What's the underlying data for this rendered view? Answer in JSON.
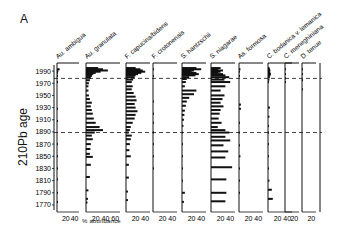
{
  "panel_label": "A",
  "chart_data": {
    "type": "bar",
    "orientation": "horizontal-stratigraphic",
    "title": "",
    "panel": "A",
    "ylabel": "210Pb age",
    "xlabel": "% abundance",
    "y_ticks": [
      1990,
      1970,
      1950,
      1930,
      1910,
      1890,
      1870,
      1850,
      1830,
      1810,
      1790,
      1770
    ],
    "ylim": [
      1765,
      2000
    ],
    "reference_lines": [
      {
        "year": 1978,
        "style": "dashed"
      },
      {
        "year": 1889,
        "style": "dashed"
      }
    ],
    "series": [
      {
        "name": "Au. ambigua",
        "x_ticks": [
          "20",
          "40"
        ],
        "xmax": 50,
        "points": [
          [
            1993,
            6
          ],
          [
            1990,
            3
          ],
          [
            1987,
            2
          ],
          [
            1982,
            1
          ],
          [
            1972,
            1
          ],
          [
            1928,
            1
          ],
          [
            1908,
            1
          ],
          [
            1870,
            1
          ],
          [
            1850,
            1
          ],
          [
            1830,
            1
          ],
          [
            1812,
            1
          ],
          [
            1790,
            1
          ],
          [
            1775,
            1
          ]
        ]
      },
      {
        "name": "Au. granulata",
        "x_ticks": [
          "20",
          "40",
          "60"
        ],
        "xmax": 70,
        "points": [
          [
            1995,
            25
          ],
          [
            1993,
            35
          ],
          [
            1991,
            45
          ],
          [
            1989,
            30
          ],
          [
            1987,
            20
          ],
          [
            1985,
            15
          ],
          [
            1982,
            12
          ],
          [
            1979,
            10
          ],
          [
            1975,
            8
          ],
          [
            1970,
            6
          ],
          [
            1965,
            5
          ],
          [
            1958,
            5
          ],
          [
            1950,
            6
          ],
          [
            1944,
            8
          ],
          [
            1938,
            12
          ],
          [
            1932,
            10
          ],
          [
            1926,
            12
          ],
          [
            1920,
            14
          ],
          [
            1912,
            16
          ],
          [
            1905,
            20
          ],
          [
            1898,
            28
          ],
          [
            1893,
            35
          ],
          [
            1889,
            18
          ],
          [
            1884,
            12
          ],
          [
            1878,
            14
          ],
          [
            1870,
            10
          ],
          [
            1862,
            9
          ],
          [
            1854,
            8
          ],
          [
            1849,
            14
          ],
          [
            1836,
            10
          ],
          [
            1816,
            8
          ],
          [
            1794,
            5
          ],
          [
            1780,
            4
          ],
          [
            1774,
            3
          ]
        ]
      },
      {
        "name": "F. capucina/bidens",
        "x_ticks": [
          "20",
          "40"
        ],
        "xmax": 50,
        "points": [
          [
            1995,
            20
          ],
          [
            1993,
            30
          ],
          [
            1991,
            35
          ],
          [
            1989,
            40
          ],
          [
            1987,
            32
          ],
          [
            1985,
            25
          ],
          [
            1983,
            20
          ],
          [
            1980,
            18
          ],
          [
            1976,
            15
          ],
          [
            1972,
            12
          ],
          [
            1965,
            14
          ],
          [
            1960,
            12
          ],
          [
            1954,
            16
          ],
          [
            1948,
            20
          ],
          [
            1942,
            22
          ],
          [
            1936,
            18
          ],
          [
            1930,
            20
          ],
          [
            1924,
            24
          ],
          [
            1918,
            20
          ],
          [
            1912,
            18
          ],
          [
            1905,
            14
          ],
          [
            1898,
            10
          ],
          [
            1893,
            8
          ],
          [
            1889,
            6
          ],
          [
            1884,
            12
          ],
          [
            1878,
            10
          ],
          [
            1870,
            8
          ],
          [
            1860,
            7
          ],
          [
            1850,
            10
          ],
          [
            1836,
            6
          ],
          [
            1815,
            6
          ],
          [
            1792,
            4
          ],
          [
            1778,
            4
          ]
        ]
      },
      {
        "name": "F. crotonensis",
        "x_ticks": [
          "20",
          "40"
        ],
        "xmax": 50,
        "points": [
          [
            1993,
            2
          ],
          [
            1982,
            1
          ],
          [
            1940,
            1
          ],
          [
            1920,
            1
          ],
          [
            1905,
            1
          ],
          [
            1889,
            1
          ],
          [
            1870,
            1
          ],
          [
            1850,
            1
          ],
          [
            1830,
            1
          ]
        ]
      },
      {
        "name": "S. hantzschii",
        "x_ticks": [
          "20",
          "40"
        ],
        "xmax": 50,
        "points": [
          [
            1995,
            30
          ],
          [
            1993,
            40
          ],
          [
            1991,
            25
          ],
          [
            1989,
            20
          ],
          [
            1987,
            30
          ],
          [
            1985,
            35
          ],
          [
            1983,
            28
          ],
          [
            1980,
            15
          ],
          [
            1977,
            10
          ],
          [
            1972,
            8
          ],
          [
            1965,
            6
          ],
          [
            1958,
            30
          ],
          [
            1952,
            25
          ],
          [
            1946,
            15
          ],
          [
            1940,
            10
          ],
          [
            1933,
            8
          ],
          [
            1925,
            6
          ],
          [
            1918,
            5
          ],
          [
            1910,
            4
          ],
          [
            1900,
            3
          ],
          [
            1889,
            2
          ],
          [
            1870,
            2
          ],
          [
            1850,
            2
          ],
          [
            1830,
            2
          ],
          [
            1810,
            2
          ],
          [
            1790,
            6
          ],
          [
            1775,
            4
          ]
        ]
      },
      {
        "name": "S. niagarae",
        "x_ticks": [
          "20",
          "40"
        ],
        "xmax": 50,
        "points": [
          [
            1995,
            20
          ],
          [
            1993,
            15
          ],
          [
            1991,
            25
          ],
          [
            1989,
            20
          ],
          [
            1987,
            15
          ],
          [
            1985,
            25
          ],
          [
            1983,
            30
          ],
          [
            1980,
            38
          ],
          [
            1976,
            28
          ],
          [
            1972,
            40
          ],
          [
            1965,
            30
          ],
          [
            1958,
            20
          ],
          [
            1950,
            28
          ],
          [
            1944,
            24
          ],
          [
            1938,
            20
          ],
          [
            1932,
            26
          ],
          [
            1926,
            20
          ],
          [
            1920,
            18
          ],
          [
            1912,
            16
          ],
          [
            1905,
            22
          ],
          [
            1898,
            14
          ],
          [
            1893,
            30
          ],
          [
            1889,
            38
          ],
          [
            1882,
            30
          ],
          [
            1876,
            40
          ],
          [
            1868,
            26
          ],
          [
            1858,
            36
          ],
          [
            1848,
            30
          ],
          [
            1832,
            44
          ],
          [
            1812,
            32
          ],
          [
            1790,
            32
          ],
          [
            1776,
            30
          ]
        ]
      },
      {
        "name": "As. formosa",
        "x_ticks": [
          "20",
          "40"
        ],
        "xmax": 50,
        "points": [
          [
            1993,
            3
          ],
          [
            1989,
            2
          ],
          [
            1982,
            2
          ],
          [
            1935,
            4
          ],
          [
            1928,
            4
          ],
          [
            1905,
            1
          ],
          [
            1889,
            1
          ],
          [
            1868,
            2
          ],
          [
            1850,
            3
          ],
          [
            1830,
            1
          ],
          [
            1810,
            1
          ],
          [
            1790,
            1
          ]
        ]
      },
      {
        "name": "C. bodanica v. lemanica",
        "x_ticks": [
          "20",
          "40"
        ],
        "xmax": 50,
        "points": [
          [
            1995,
            3
          ],
          [
            1993,
            4
          ],
          [
            1991,
            5
          ],
          [
            1989,
            4
          ],
          [
            1987,
            5
          ],
          [
            1985,
            6
          ],
          [
            1983,
            5
          ],
          [
            1980,
            4
          ],
          [
            1976,
            3
          ],
          [
            1972,
            2
          ],
          [
            1930,
            4
          ],
          [
            1915,
            3
          ],
          [
            1900,
            2
          ],
          [
            1889,
            2
          ],
          [
            1870,
            2
          ],
          [
            1850,
            2
          ],
          [
            1830,
            2
          ],
          [
            1810,
            3
          ],
          [
            1795,
            8
          ],
          [
            1780,
            10
          ]
        ]
      },
      {
        "name": "C. meneghiniana",
        "x_ticks": [
          "20"
        ],
        "xmax": 30,
        "points": [
          [
            1993,
            2
          ],
          [
            1985,
            1
          ],
          [
            1978,
            2
          ],
          [
            1972,
            1
          ]
        ]
      },
      {
        "name": "D. tenue",
        "x_ticks": [
          "20"
        ],
        "xmax": 30,
        "points": [
          [
            1993,
            1
          ],
          [
            1985,
            1
          ],
          [
            1975,
            1
          ],
          [
            1960,
            1
          ]
        ]
      }
    ]
  }
}
